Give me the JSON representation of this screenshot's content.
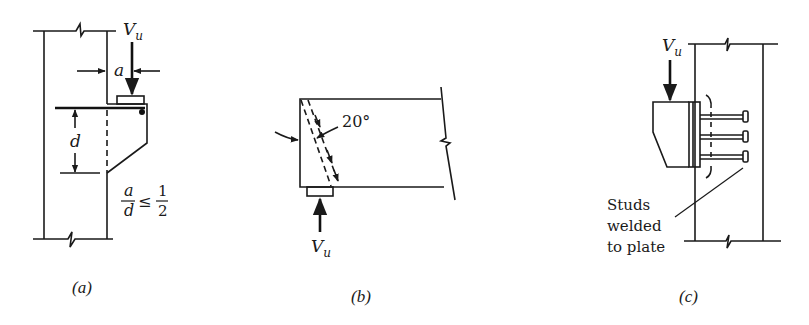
{
  "figure": {
    "panels": [
      {
        "id": "a",
        "caption": "(a)",
        "description": "Corbel projecting from column with bearing plate and tension bar",
        "load_label": "V",
        "load_subscript": "u",
        "shear_span_label": "a",
        "depth_label": "d",
        "ratio": {
          "numerator": "a",
          "denominator": "d",
          "operator": "≤",
          "limit_numerator": "1",
          "limit_denominator": "2"
        }
      },
      {
        "id": "b",
        "caption": "(b)",
        "description": "Beam end with inclined crack at 20° near support bearing",
        "angle_label": "20°",
        "load_label": "V",
        "load_subscript": "u"
      },
      {
        "id": "c",
        "caption": "(c)",
        "description": "Steel bracket attached to column via plate with welded studs",
        "load_label": "V",
        "load_subscript": "u",
        "note_lines": [
          "Studs",
          "welded",
          "to plate"
        ]
      }
    ],
    "colors": {
      "line": "#1a1a1a",
      "background": "#ffffff"
    }
  }
}
